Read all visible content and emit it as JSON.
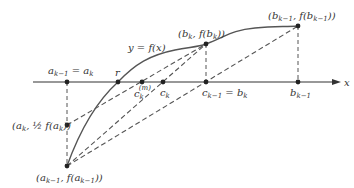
{
  "diagram": {
    "colors": {
      "ink": "#333333",
      "curve": "#555555",
      "dashed": "#555555",
      "background": "#ffffff"
    },
    "axis": {
      "label": "x"
    },
    "curve_label": "y = f(x)",
    "points": {
      "a_prev_eq_a": {
        "label_main": "a",
        "label_sub1": "k−1",
        "label_eq": " = a",
        "label_sub2": "k"
      },
      "r": {
        "label": "r"
      },
      "c_m": {
        "label_main": "c",
        "label_sub": "k",
        "label_sup": "(m)"
      },
      "c_k": {
        "label_main": "c",
        "label_sub": "k"
      },
      "c_prev_eq_b": {
        "label_main": "c",
        "label_sub1": "k−1",
        "label_eq": " = b",
        "label_sub2": "k"
      },
      "b_prev": {
        "label_main": "b",
        "label_sub": "k−1"
      },
      "bk_fbk": {
        "label": "(b",
        "sub": "k",
        "mid": ", f(b",
        "sub2": "k",
        "end": "))"
      },
      "bprev_fbprev": {
        "label": "(b",
        "sub": "k−1",
        "mid": ", f(b",
        "sub2": "k−1",
        "end": "))"
      },
      "ak_half": {
        "label": "(a",
        "sub": "k",
        "mid": ", ½ f(a",
        "sub2": "k",
        "end": "))"
      },
      "aprev_faprev": {
        "label": "(a",
        "sub": "k−1",
        "mid": ", f(a",
        "sub2": "k−1",
        "end": "))"
      }
    }
  }
}
